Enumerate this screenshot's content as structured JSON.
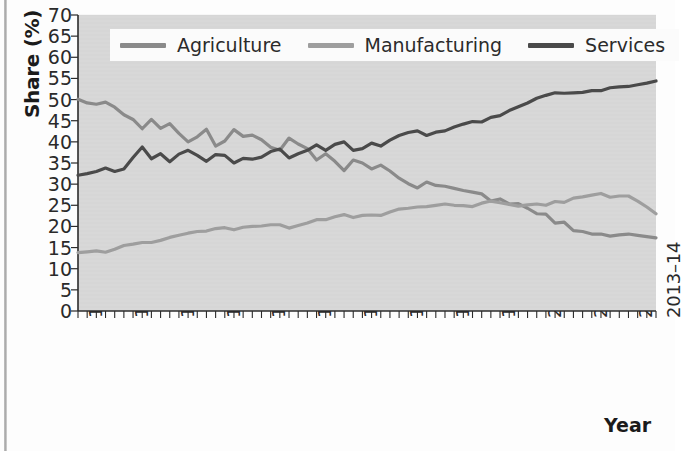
{
  "chart_data": {
    "type": "line",
    "title": "",
    "xlabel": "Year",
    "ylabel": "Share (%)",
    "ylim": [
      0,
      70
    ],
    "ytick_step": 5,
    "yticks": [
      70,
      65,
      60,
      55,
      50,
      45,
      40,
      35,
      30,
      25,
      20,
      15,
      10,
      5,
      0
    ],
    "grid": false,
    "legend_position": "top-center",
    "x_tick_labels": [
      "1950–51",
      "1955–56",
      "1960–61",
      "1965–66",
      "1970–71",
      "1975–76",
      "1980–81",
      "1985–86",
      "1990–91",
      "1995–96",
      "2000–01",
      "2005–06",
      "2010–11",
      "2013–14"
    ],
    "x_tick_indices": [
      0,
      5,
      10,
      15,
      20,
      25,
      30,
      35,
      40,
      45,
      50,
      55,
      60,
      63
    ],
    "x": [
      "1950-51",
      "1951-52",
      "1952-53",
      "1953-54",
      "1954-55",
      "1955-56",
      "1956-57",
      "1957-58",
      "1958-59",
      "1959-60",
      "1960-61",
      "1961-62",
      "1962-63",
      "1963-64",
      "1964-65",
      "1965-66",
      "1966-67",
      "1967-68",
      "1968-69",
      "1969-70",
      "1970-71",
      "1971-72",
      "1972-73",
      "1973-74",
      "1974-75",
      "1975-76",
      "1976-77",
      "1977-78",
      "1978-79",
      "1979-80",
      "1980-81",
      "1981-82",
      "1982-83",
      "1983-84",
      "1984-85",
      "1985-86",
      "1986-87",
      "1987-88",
      "1988-89",
      "1989-90",
      "1990-91",
      "1991-92",
      "1992-93",
      "1993-94",
      "1994-95",
      "1995-96",
      "1996-97",
      "1997-98",
      "1998-99",
      "1999-00",
      "2000-01",
      "2001-02",
      "2002-03",
      "2003-04",
      "2004-05",
      "2005-06",
      "2006-07",
      "2007-08",
      "2008-09",
      "2009-10",
      "2010-11",
      "2011-12",
      "2012-13",
      "2013-14"
    ],
    "series": [
      {
        "name": "Agriculture",
        "color": "#8a8a8a",
        "values": [
          50.1,
          49.2,
          48.9,
          49.4,
          48.2,
          46.4,
          45.3,
          43.1,
          45.3,
          43.2,
          44.3,
          42.0,
          40.0,
          41.2,
          43.0,
          39.0,
          40.2,
          42.9,
          41.3,
          41.6,
          40.5,
          38.7,
          38.0,
          40.9,
          39.5,
          38.4,
          35.7,
          37.2,
          35.4,
          33.2,
          35.7,
          35.0,
          33.6,
          34.5,
          33.1,
          31.4,
          30.1,
          29.1,
          30.5,
          29.7,
          29.5,
          29.0,
          28.5,
          28.1,
          27.7,
          26.0,
          26.5,
          25.3,
          25.4,
          24.3,
          23.0,
          22.9,
          20.8,
          21.0,
          19.0,
          18.8,
          18.2,
          18.2,
          17.7,
          18.0,
          18.2,
          17.9,
          17.6,
          17.3
        ]
      },
      {
        "name": "Manufacturing",
        "color": "#9e9e9e",
        "values": [
          13.8,
          14.0,
          14.2,
          13.9,
          14.6,
          15.5,
          15.8,
          16.2,
          16.2,
          16.7,
          17.4,
          17.9,
          18.4,
          18.8,
          18.9,
          19.5,
          19.7,
          19.2,
          19.8,
          20.0,
          20.1,
          20.4,
          20.4,
          19.6,
          20.2,
          20.8,
          21.6,
          21.6,
          22.3,
          22.8,
          22.1,
          22.6,
          22.7,
          22.6,
          23.4,
          24.1,
          24.3,
          24.6,
          24.7,
          25.0,
          25.3,
          25.0,
          24.9,
          24.7,
          25.5,
          26.0,
          25.6,
          25.2,
          24.8,
          25.1,
          25.3,
          25.0,
          25.9,
          25.7,
          26.7,
          27.0,
          27.4,
          27.8,
          26.9,
          27.2,
          27.2,
          26.0,
          24.6,
          23.0
        ]
      },
      {
        "name": "Services",
        "color": "#4a4a4a",
        "values": [
          32.1,
          32.5,
          33.0,
          33.8,
          33.0,
          33.6,
          36.3,
          38.8,
          36.0,
          37.2,
          35.3,
          37.1,
          38.0,
          36.8,
          35.4,
          37.0,
          36.8,
          35.0,
          36.1,
          35.9,
          36.4,
          37.7,
          38.3,
          36.2,
          37.2,
          38.0,
          39.3,
          38.0,
          39.4,
          40.0,
          38.0,
          38.4,
          39.7,
          39.0,
          40.4,
          41.5,
          42.2,
          42.6,
          41.5,
          42.3,
          42.6,
          43.5,
          44.2,
          44.8,
          44.7,
          45.8,
          46.2,
          47.4,
          48.3,
          49.2,
          50.3,
          51.0,
          51.6,
          51.5,
          51.6,
          51.7,
          52.1,
          52.1,
          52.8,
          53.0,
          53.1,
          53.5,
          53.9,
          54.4
        ]
      }
    ]
  },
  "legend": {
    "items": [
      {
        "label": "Agriculture",
        "color": "#8a8a8a"
      },
      {
        "label": "Manufacturing",
        "color": "#9e9e9e"
      },
      {
        "label": "Services",
        "color": "#4a4a4a"
      }
    ]
  },
  "axes": {
    "y_title": "Share (%)",
    "x_title": "Year"
  }
}
